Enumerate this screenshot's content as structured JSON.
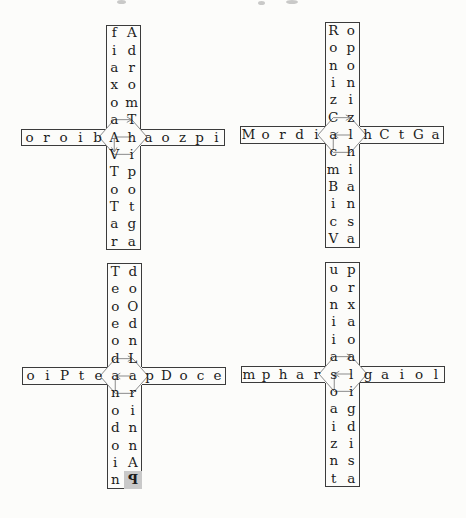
{
  "style": {
    "paper": "#fcfcfa",
    "border_color": "#3b3b3b",
    "letter_color": "#1c1c1c",
    "line_color": "#8b8b8b",
    "highlight_color": "#c9c9c9"
  },
  "crosses": [
    {
      "name": "top-left",
      "left_column": [
        "f",
        "i",
        "a",
        "x",
        "o",
        "a",
        "A",
        "V",
        "T",
        "o",
        "T",
        "a",
        "r"
      ],
      "right_column": [
        "A",
        "d",
        "r",
        "o",
        "m",
        "T",
        "h",
        "i",
        "p",
        "o",
        "t",
        "g",
        "a"
      ],
      "row_left": [
        "o",
        "r",
        "o",
        "i",
        "b"
      ],
      "row_right": [
        "a",
        "o",
        "z",
        "p",
        "i"
      ],
      "arrows": {
        "top": "right",
        "middle": "none",
        "vertical": "down"
      }
    },
    {
      "name": "top-right",
      "left_column": [
        "R",
        "o",
        "n",
        "i",
        "z",
        "C",
        "a",
        "c",
        "m",
        "B",
        "i",
        "c",
        "V"
      ],
      "right_column": [
        "o",
        "p",
        "o",
        "n",
        "i",
        "z",
        "l",
        "h",
        "i",
        "a",
        "n",
        "s",
        "a"
      ],
      "row_left": [
        "M",
        "o",
        "r",
        "d",
        "i"
      ],
      "row_right": [
        "h",
        "C",
        "t",
        "G",
        "a"
      ],
      "arrows": {
        "top": "right",
        "middle": "left",
        "vertical": "none"
      }
    },
    {
      "name": "bottom-left",
      "left_column": [
        "T",
        "e",
        "o",
        "e",
        "o",
        "d",
        "a",
        "n",
        "o",
        "d",
        "o",
        "i",
        "n"
      ],
      "right_column": [
        "d",
        "o",
        "O",
        "d",
        "n",
        "L",
        "a",
        "r",
        "i",
        "n",
        "n",
        "A",
        "P"
      ],
      "row_left": [
        "o",
        "i",
        "P",
        "t",
        "e"
      ],
      "row_right": [
        "p",
        "D",
        "o",
        "c",
        "e"
      ],
      "arrows": {
        "top": "right",
        "middle": "left",
        "vertical": "none"
      },
      "highlight_cell": {
        "column": "right",
        "row": 12,
        "mirrored": true
      }
    },
    {
      "name": "bottom-right",
      "left_column": [
        "u",
        "o",
        "n",
        "i",
        "i",
        "a",
        "s",
        "o",
        "a",
        "i",
        "z",
        "n",
        "t"
      ],
      "right_column": [
        "p",
        "r",
        "x",
        "a",
        "o",
        "a",
        "l",
        "i",
        "g",
        "d",
        "i",
        "s",
        "a"
      ],
      "row_left": [
        "m",
        "p",
        "h",
        "a",
        "r"
      ],
      "row_right": [
        "g",
        "a",
        "i",
        "o",
        "l"
      ],
      "arrows": {
        "top": "right",
        "middle": "left",
        "vertical": "none"
      }
    }
  ]
}
